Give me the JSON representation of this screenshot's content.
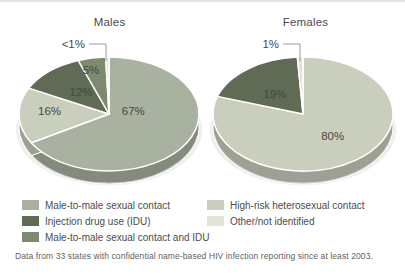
{
  "page": {
    "footnote": "Data from 33 states with confidential name-based HIV infection reporting since at least 2003."
  },
  "palette": {
    "msm": "#a9b2a0",
    "het": "#c9cfbc",
    "idu": "#5f6b54",
    "msm_idu": "#7e8a6e",
    "other": "#e0e3d6",
    "label_text": "#474747",
    "leader_line": "#9a9a9a"
  },
  "legend": {
    "columns": [
      {
        "items": [
          {
            "label": "Male-to-male sexual contact",
            "color_key": "msm"
          },
          {
            "label": "Injection drug use (IDU)",
            "color_key": "idu"
          },
          {
            "label": "Male-to-male sexual contact and IDU",
            "color_key": "msm_idu"
          }
        ]
      },
      {
        "items": [
          {
            "label": "High-risk heterosexual contact",
            "color_key": "het"
          },
          {
            "label": "Other/not identified",
            "color_key": "other"
          }
        ]
      }
    ]
  },
  "chart_data": [
    {
      "type": "pie",
      "title": "Males",
      "unit": "percent",
      "style": "3d-exploded-outline",
      "slices": [
        {
          "label": "Male-to-male sexual contact",
          "value": 67,
          "display": "67%",
          "color_key": "msm",
          "label_pos": [
            0.27,
            -0.06
          ]
        },
        {
          "label": "High-risk heterosexual contact",
          "value": 16,
          "display": "16%",
          "color_key": "het",
          "label_pos": [
            -0.66,
            -0.05
          ]
        },
        {
          "label": "Injection drug use (IDU)",
          "value": 12,
          "display": "12%",
          "color_key": "idu",
          "label_pos": [
            -0.31,
            -0.39
          ]
        },
        {
          "label": "Male-to-male sexual contact and IDU",
          "value": 5,
          "display": "5%",
          "color_key": "msm_idu",
          "label_pos": [
            -0.2,
            -0.77
          ]
        },
        {
          "label": "Other/not identified",
          "value": 0.6,
          "display": "<1%",
          "color_key": "other",
          "outside": true
        }
      ]
    },
    {
      "type": "pie",
      "title": "Females",
      "unit": "percent",
      "style": "3d-exploded-outline",
      "slices": [
        {
          "label": "High-risk heterosexual contact",
          "value": 80,
          "display": "80%",
          "color_key": "het",
          "label_pos": [
            0.33,
            0.39
          ]
        },
        {
          "label": "Injection drug use (IDU)",
          "value": 19,
          "display": "19%",
          "color_key": "idu",
          "label_pos": [
            -0.31,
            -0.35
          ]
        },
        {
          "label": "Other/not identified",
          "value": 1,
          "display": "1%",
          "color_key": "other",
          "outside": true
        }
      ]
    }
  ]
}
